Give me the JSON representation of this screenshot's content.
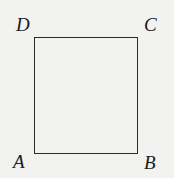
{
  "figure": {
    "shape": "square",
    "vertices": {
      "top_left": "D",
      "top_right": "C",
      "bottom_left": "A",
      "bottom_right": "B"
    },
    "line_color": "#2a2a2a",
    "background_color": "#f2f2f0"
  }
}
